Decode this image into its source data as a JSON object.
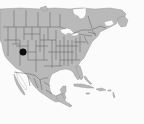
{
  "map": {
    "region": "North America",
    "projection_extent": "Canada (south) to Central America and Caribbean",
    "colors": {
      "land": "#b9b9b9",
      "water": "#fbfbfb",
      "borders": "#5e5e5e",
      "marker": "#0c0c0c"
    },
    "markers": [
      {
        "label": "occurrence-point",
        "x": 23,
        "y": 52,
        "radius": 3.5,
        "approx_location": "Utah / Colorado, USA"
      }
    ]
  }
}
